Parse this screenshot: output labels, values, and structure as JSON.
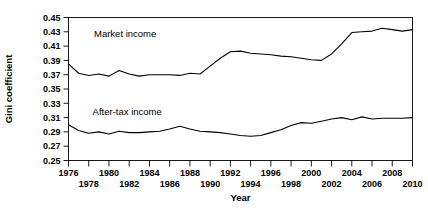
{
  "chart_data": {
    "type": "line",
    "title": "",
    "xlabel": "Year",
    "ylabel": "Gini coefficient",
    "xlim": [
      1976,
      2010
    ],
    "ylim": [
      0.25,
      0.45
    ],
    "ytick_step": 0.02,
    "xtick_step": 1,
    "grid": false,
    "legend": "inline-annotations",
    "yticks": [
      "0.45",
      "0.43",
      "0.41",
      "0.39",
      "0.37",
      "0.35",
      "0.33",
      "0.31",
      "0.29",
      "0.27",
      "0.25"
    ],
    "ytick_values": [
      0.45,
      0.43,
      0.41,
      0.39,
      0.37,
      0.35,
      0.33,
      0.31,
      0.29,
      0.27,
      0.25
    ],
    "xticks_upper_row": [
      "1976",
      "1980",
      "1984",
      "1988",
      "1992",
      "1996",
      "2000",
      "2004",
      "2008"
    ],
    "xticks_lower_row": [
      "1978",
      "1982",
      "1986",
      "1990",
      "1994",
      "1998",
      "2002",
      "2006",
      "2010"
    ],
    "xtick_values_upper": [
      1976,
      1980,
      1984,
      1988,
      1992,
      1996,
      2000,
      2004,
      2008
    ],
    "xtick_values_lower": [
      1978,
      1982,
      1986,
      1990,
      1994,
      1998,
      2002,
      2006,
      2010
    ],
    "x": [
      1976,
      1977,
      1978,
      1979,
      1980,
      1981,
      1982,
      1983,
      1984,
      1985,
      1986,
      1987,
      1988,
      1989,
      1990,
      1991,
      1992,
      1993,
      1994,
      1995,
      1996,
      1997,
      1998,
      1999,
      2000,
      2001,
      2002,
      2003,
      2004,
      2005,
      2006,
      2007,
      2008,
      2009,
      2010
    ],
    "series": [
      {
        "name": "Market income",
        "label": "Market income",
        "color": "#000000",
        "values": [
          0.385,
          0.372,
          0.369,
          0.371,
          0.368,
          0.376,
          0.371,
          0.368,
          0.37,
          0.37,
          0.37,
          0.369,
          0.372,
          0.371,
          0.382,
          0.393,
          0.402,
          0.403,
          0.4,
          0.399,
          0.398,
          0.396,
          0.395,
          0.393,
          0.391,
          0.39,
          0.399,
          0.413,
          0.429,
          0.43,
          0.431,
          0.435,
          0.433,
          0.431,
          0.433
        ]
      },
      {
        "name": "After-tax income",
        "label": "After-tax income",
        "color": "#000000",
        "values": [
          0.3,
          0.292,
          0.288,
          0.29,
          0.287,
          0.291,
          0.289,
          0.289,
          0.29,
          0.291,
          0.294,
          0.298,
          0.294,
          0.291,
          0.29,
          0.289,
          0.287,
          0.285,
          0.284,
          0.285,
          0.289,
          0.293,
          0.299,
          0.303,
          0.302,
          0.305,
          0.308,
          0.31,
          0.307,
          0.311,
          0.308,
          0.309,
          0.309,
          0.309,
          0.31
        ]
      }
    ],
    "annotations": [
      {
        "text": "Market income",
        "x": 1981.6,
        "y": 0.423
      },
      {
        "text": "After-tax income",
        "x": 1981.8,
        "y": 0.313
      }
    ],
    "axis_color": "#000000"
  }
}
